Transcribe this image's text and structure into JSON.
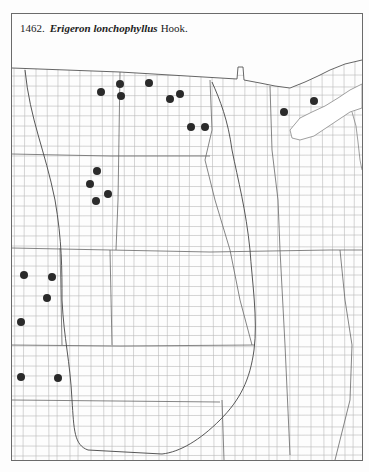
{
  "title": {
    "number": "1462.",
    "species": "Erigeron lonchophyllus",
    "author": "Hook."
  },
  "colors": {
    "frame": "#6b6b6b",
    "county_lines": "#b4b4b4",
    "state_lines": "#555555",
    "boundary_curve": "#444444",
    "dot": "#2a2a2a"
  },
  "map": {
    "region": "Great Plains / Upper Midwest county outline map",
    "occurrence_dots": [
      {
        "x": 101,
        "y": 92
      },
      {
        "x": 120,
        "y": 84
      },
      {
        "x": 121,
        "y": 96
      },
      {
        "x": 149,
        "y": 83
      },
      {
        "x": 170,
        "y": 99
      },
      {
        "x": 180,
        "y": 94
      },
      {
        "x": 191,
        "y": 127
      },
      {
        "x": 205,
        "y": 127
      },
      {
        "x": 284,
        "y": 112
      },
      {
        "x": 314,
        "y": 101
      },
      {
        "x": 97,
        "y": 171
      },
      {
        "x": 90,
        "y": 184
      },
      {
        "x": 108,
        "y": 194
      },
      {
        "x": 96,
        "y": 201
      },
      {
        "x": 24,
        "y": 275
      },
      {
        "x": 52,
        "y": 277
      },
      {
        "x": 47,
        "y": 298
      },
      {
        "x": 21,
        "y": 322
      },
      {
        "x": 21,
        "y": 377
      },
      {
        "x": 58,
        "y": 378
      }
    ],
    "dot_radius": 4
  }
}
